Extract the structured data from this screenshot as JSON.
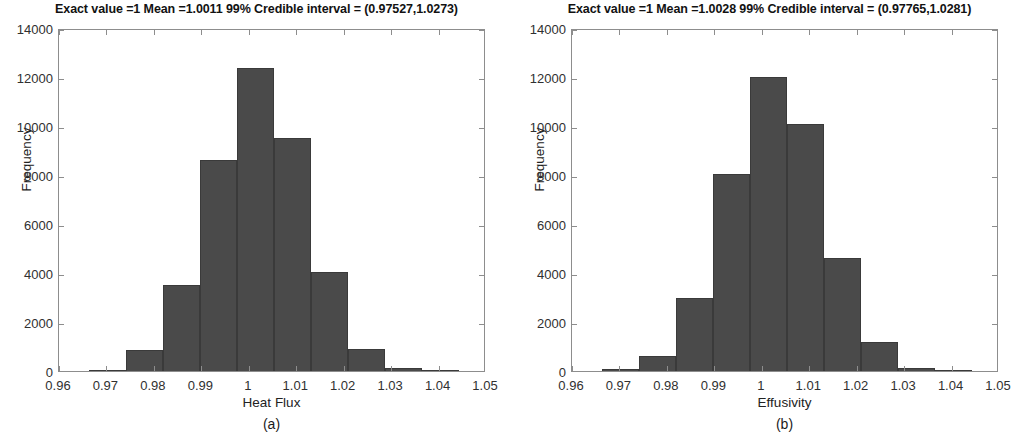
{
  "figure": {
    "background": "#ffffff",
    "bar_color": "#4a4a4a",
    "axis_color": "#8d8d8d"
  },
  "panels": [
    {
      "id": "a",
      "caption": "(a)",
      "title": "Exact value =1  Mean =1.0011  99% Credible interval = (0.97527,1.0273)",
      "exact_value": "1",
      "mean": "1.0011",
      "credible_level": "99%",
      "credible_interval_low": "0.97527",
      "credible_interval_high": "1.0273",
      "xlabel": "Heat Flux",
      "ylabel": "Frequency"
    },
    {
      "id": "b",
      "caption": "(b)",
      "title": "Exact value =1  Mean =1.0028  99% Credible interval = (0.97765,1.0281)",
      "exact_value": "1",
      "mean": "1.0028",
      "credible_level": "99%",
      "credible_interval_low": "0.97765",
      "credible_interval_high": "1.0281",
      "xlabel": "Effusivity",
      "ylabel": "Frequency"
    }
  ],
  "chart_data": [
    {
      "type": "bar",
      "title": "Exact value =1  Mean =1.0011  99% Credible interval = (0.97527,1.0273)",
      "xlabel": "Heat Flux",
      "ylabel": "Frequency",
      "xlim": [
        0.96,
        1.05
      ],
      "ylim": [
        0,
        14000
      ],
      "xticks": [
        0.96,
        0.97,
        0.98,
        0.99,
        1,
        1.01,
        1.02,
        1.03,
        1.04,
        1.05
      ],
      "xtick_labels": [
        "0.96",
        "0.97",
        "0.98",
        "0.99",
        "1",
        "1.01",
        "1.02",
        "1.03",
        "1.04",
        "1.05"
      ],
      "yticks": [
        0,
        2000,
        4000,
        6000,
        8000,
        10000,
        12000,
        14000
      ],
      "ytick_labels": [
        "0",
        "2000",
        "4000",
        "6000",
        "8000",
        "10000",
        "12000",
        "14000"
      ],
      "grid": false,
      "legend": null,
      "bin_edges": [
        0.9663,
        0.9741,
        0.9819,
        0.9897,
        0.9975,
        1.0053,
        1.0131,
        1.0209,
        1.0287,
        1.0365,
        1.0443
      ],
      "values": [
        60,
        850,
        3500,
        8600,
        12350,
        9500,
        4050,
        900,
        110,
        20
      ],
      "bars": [
        {
          "x0": 0.9663,
          "x1": 0.9741,
          "height": 60
        },
        {
          "x0": 0.9741,
          "x1": 0.9819,
          "height": 850
        },
        {
          "x0": 0.9819,
          "x1": 0.9897,
          "height": 3500
        },
        {
          "x0": 0.9897,
          "x1": 0.9975,
          "height": 8600
        },
        {
          "x0": 0.9975,
          "x1": 1.0053,
          "height": 12350
        },
        {
          "x0": 1.0053,
          "x1": 1.0131,
          "height": 9500
        },
        {
          "x0": 1.0131,
          "x1": 1.0209,
          "height": 4050
        },
        {
          "x0": 1.0209,
          "x1": 1.0287,
          "height": 900
        },
        {
          "x0": 1.0287,
          "x1": 1.0365,
          "height": 110
        },
        {
          "x0": 1.0365,
          "x1": 1.0443,
          "height": 20
        }
      ]
    },
    {
      "type": "bar",
      "title": "Exact value =1  Mean =1.0028  99% Credible interval = (0.97765,1.0281)",
      "xlabel": "Effusivity",
      "ylabel": "Frequency",
      "xlim": [
        0.96,
        1.05
      ],
      "ylim": [
        0,
        14000
      ],
      "xticks": [
        0.96,
        0.97,
        0.98,
        0.99,
        1,
        1.01,
        1.02,
        1.03,
        1.04,
        1.05
      ],
      "xtick_labels": [
        "0.96",
        "0.97",
        "0.98",
        "0.99",
        "1",
        "1.01",
        "1.02",
        "1.03",
        "1.04",
        "1.05"
      ],
      "yticks": [
        0,
        2000,
        4000,
        6000,
        8000,
        10000,
        12000,
        14000
      ],
      "ytick_labels": [
        "0",
        "2000",
        "4000",
        "6000",
        "8000",
        "10000",
        "12000",
        "14000"
      ],
      "grid": false,
      "legend": null,
      "bin_edges": [
        0.9663,
        0.9741,
        0.9819,
        0.9897,
        0.9975,
        1.0053,
        1.0131,
        1.0209,
        1.0287,
        1.0365,
        1.0443
      ],
      "values": [
        70,
        620,
        2980,
        8050,
        12000,
        10100,
        4620,
        1200,
        130,
        25
      ],
      "bars": [
        {
          "x0": 0.9663,
          "x1": 0.9741,
          "height": 70
        },
        {
          "x0": 0.9741,
          "x1": 0.9819,
          "height": 620
        },
        {
          "x0": 0.9819,
          "x1": 0.9897,
          "height": 2980
        },
        {
          "x0": 0.9897,
          "x1": 0.9975,
          "height": 8050
        },
        {
          "x0": 0.9975,
          "x1": 1.0053,
          "height": 12000
        },
        {
          "x0": 1.0053,
          "x1": 1.0131,
          "height": 10100
        },
        {
          "x0": 1.0131,
          "x1": 1.0209,
          "height": 4620
        },
        {
          "x0": 1.0209,
          "x1": 1.0287,
          "height": 1200
        },
        {
          "x0": 1.0287,
          "x1": 1.0365,
          "height": 130
        },
        {
          "x0": 1.0365,
          "x1": 1.0443,
          "height": 25
        }
      ]
    }
  ]
}
